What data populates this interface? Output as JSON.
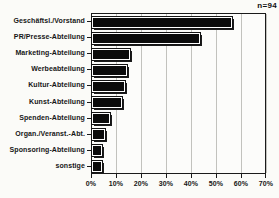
{
  "chart_data": {
    "type": "bar",
    "orientation": "horizontal",
    "title": "",
    "annotation": "n=94",
    "categories": [
      "Geschäftsl./Vorstand",
      "PR/Presse-Abteilung",
      "Marketing-Abteilung",
      "Werbeabteilung",
      "Kultur-Abteilung",
      "Kunst-Abteilung",
      "Spenden-Abteilung",
      "Organ./Veranst.-Abt.",
      "Sponsoring-Abteilung",
      "sonstige"
    ],
    "values": [
      56,
      43,
      15,
      14,
      13,
      12,
      7,
      5,
      4,
      4
    ],
    "unit": "%",
    "xlabel": "",
    "ylabel": "",
    "xlim": [
      0,
      70
    ],
    "x_ticks": [
      "0%",
      "10%",
      "20%",
      "30%",
      "40%",
      "50%",
      "60%",
      "70%"
    ],
    "grid": true,
    "bar_color": "#0b0b0b",
    "background": "#fbfbf8"
  }
}
